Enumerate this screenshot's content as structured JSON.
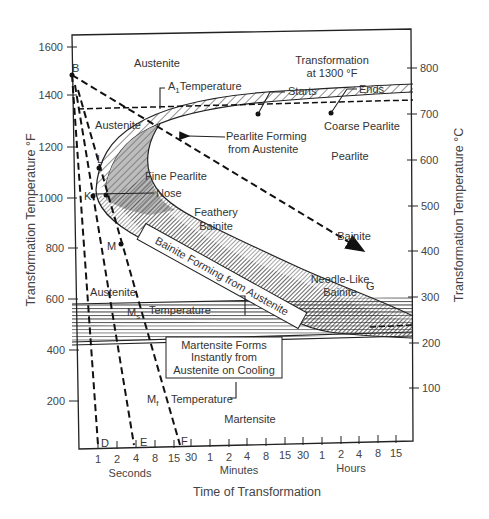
{
  "diagram": {
    "type": "TTT diagram (time-temperature-transformation)",
    "left_axis": {
      "title": "Transformation Temperature °F",
      "ticks": [
        "1600",
        "1400",
        "1200",
        "1000",
        "800",
        "600",
        "400",
        "200"
      ]
    },
    "right_axis": {
      "title": "Transformation Temperature °C",
      "ticks": [
        "800",
        "700",
        "600",
        "500",
        "400",
        "300",
        "200",
        "100"
      ]
    },
    "x_axis": {
      "title": "Time of Transformation",
      "ticks": [
        "1",
        "2",
        "4",
        "8",
        "15",
        "30",
        "1",
        "2",
        "4",
        "8",
        "15",
        "30",
        "1",
        "2",
        "4",
        "8",
        "15"
      ],
      "groups": [
        "Seconds",
        "Minutes",
        "Hours"
      ]
    },
    "regions": {
      "austenite_top": "Austenite",
      "austenite_mid": "Austenite",
      "austenite_low": "Austenite",
      "coarse_pearlite": "Coarse Pearlite",
      "pearlite": "Pearlite",
      "fine_pearlite": "Fine Pearlite",
      "feathery_bainite_1": "Feathery",
      "feathery_bainite_2": "Bainite",
      "bainite": "Bainite",
      "needle_bainite_1": "Needle-Like",
      "needle_bainite_2": "Bainite",
      "martensite": "Martensite"
    },
    "annotations": {
      "transformation_1": "Transformation",
      "transformation_2": "at 1300 °F",
      "starts": "Starts",
      "ends": "Ends",
      "a1_prefix": "A",
      "a1_sub": "1",
      "a1_suffix": "Temperature",
      "pearlite_forming_1": "Pearlite Forming",
      "pearlite_forming_2": "from Austenite",
      "nose": "Nose",
      "bainite_forming": "Bainite Forming from Austenite",
      "ms_prefix": "M",
      "ms_sub": "s",
      "ms_temperature": "Temperature",
      "mf_prefix": "M",
      "mf_sub": "f",
      "mf_temperature": "Temperature",
      "martensite_box_1": "Martensite Forms",
      "martensite_box_2": "Instantly from",
      "martensite_box_3": "Austenite  on  Cooling"
    },
    "points": {
      "B": "B",
      "L": "L",
      "K": "K",
      "M": "M",
      "D": "D",
      "E": "E",
      "F": "F",
      "G": "G"
    },
    "colors": {
      "line": "#222222",
      "text": "#333333",
      "background": "#ffffff"
    }
  }
}
